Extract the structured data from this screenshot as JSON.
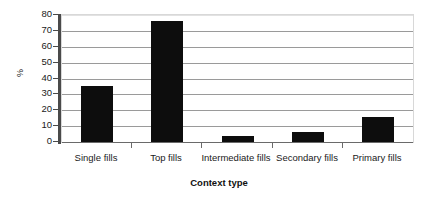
{
  "chart_data": {
    "type": "bar",
    "title": "",
    "xlabel": "Context type",
    "ylabel": "%",
    "categories": [
      "Single fills",
      "Top fills",
      "Intermediate fills",
      "Secondary fills",
      "Primary fills"
    ],
    "values": [
      35,
      76,
      4,
      6,
      16
    ],
    "ylim": [
      0,
      80
    ],
    "ytick_step": 10,
    "yticks": [
      "0",
      "10",
      "20",
      "30",
      "40",
      "50",
      "60",
      "70",
      "80"
    ],
    "grid": true,
    "grid_axis": "y",
    "legend": false,
    "legend_position": "none",
    "series": [
      {
        "name": "%",
        "color": "#0d0d0d",
        "values": [
          35,
          76,
          4,
          6,
          16
        ]
      }
    ]
  },
  "axis": {
    "y_title": "%",
    "x_title": "Context type"
  },
  "colors": {
    "bar": "#0d0d0d",
    "gridline": "#9a9a9a",
    "axis": "#4a4a4a",
    "plot_border": "#d8d8d8",
    "background": "#ffffff",
    "text": "#1a1a1a"
  }
}
